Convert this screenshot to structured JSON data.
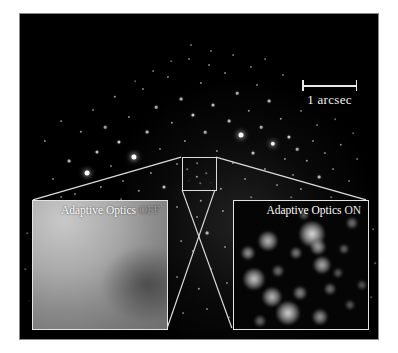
{
  "figure": {
    "background_color": "#ffffff",
    "sky_color": "#000000",
    "frame_border_color": "#8a8a8a"
  },
  "scalebar": {
    "label": "1 arcsec",
    "color": "#f2f2f2",
    "x": 301,
    "y": 79,
    "length_px": 55
  },
  "roi": {
    "name": "zoom-region",
    "x": 181,
    "y": 156,
    "width": 35,
    "height": 34,
    "border_color": "#dcdcdc"
  },
  "insets": {
    "left": {
      "label_main": "Adaptive Optics",
      "label_state": "OFF",
      "x": 31,
      "y": 199,
      "width": 136,
      "height": 130,
      "border_color": "#e4e4e4",
      "description": "seeing-limited blurred image, unresolved gray blob"
    },
    "right": {
      "label_main": "Adaptive Optics",
      "label_state": "ON",
      "x": 232,
      "y": 199,
      "width": 136,
      "height": 130,
      "border_color": "#e4e4e4",
      "description": "diffraction-limited image, individual stars resolved"
    }
  },
  "connectors": {
    "color": "#dcdcdc",
    "lines": [
      {
        "name": "roi-topleft-to-left-inset",
        "x1": 181,
        "y1": 157,
        "x2": 32,
        "y2": 200
      },
      {
        "name": "roi-topright-to-right-inset",
        "x1": 216,
        "y1": 157,
        "x2": 367,
        "y2": 200
      },
      {
        "name": "roi-bottomleft-to-right-inset",
        "x1": 182,
        "y1": 190,
        "x2": 232,
        "y2": 329
      },
      {
        "name": "roi-bottomright-to-left-inset",
        "x1": 215,
        "y1": 190,
        "x2": 167,
        "y2": 329
      }
    ]
  },
  "starfield": [
    {
      "x": 44,
      "y": 140,
      "r": 1.1,
      "o": 0.55
    },
    {
      "x": 52,
      "y": 178,
      "r": 1.0,
      "o": 0.5
    },
    {
      "x": 60,
      "y": 120,
      "r": 0.9,
      "o": 0.45
    },
    {
      "x": 68,
      "y": 160,
      "r": 1.4,
      "o": 0.7
    },
    {
      "x": 74,
      "y": 193,
      "r": 1.0,
      "o": 0.5
    },
    {
      "x": 80,
      "y": 131,
      "r": 1.2,
      "o": 0.6
    },
    {
      "x": 86,
      "y": 172,
      "r": 2.4,
      "o": 1.0
    },
    {
      "x": 92,
      "y": 109,
      "r": 1.0,
      "o": 0.5
    },
    {
      "x": 96,
      "y": 151,
      "r": 1.5,
      "o": 0.75
    },
    {
      "x": 100,
      "y": 186,
      "r": 1.1,
      "o": 0.55
    },
    {
      "x": 104,
      "y": 126,
      "r": 1.3,
      "o": 0.62
    },
    {
      "x": 110,
      "y": 165,
      "r": 1.0,
      "o": 0.5
    },
    {
      "x": 114,
      "y": 96,
      "r": 1.2,
      "o": 0.6
    },
    {
      "x": 118,
      "y": 141,
      "r": 1.6,
      "o": 0.8
    },
    {
      "x": 122,
      "y": 180,
      "r": 1.0,
      "o": 0.5
    },
    {
      "x": 128,
      "y": 116,
      "r": 1.1,
      "o": 0.55
    },
    {
      "x": 133,
      "y": 156,
      "r": 2.6,
      "o": 1.0
    },
    {
      "x": 138,
      "y": 190,
      "r": 1.2,
      "o": 0.58
    },
    {
      "x": 142,
      "y": 88,
      "r": 1.0,
      "o": 0.5
    },
    {
      "x": 146,
      "y": 131,
      "r": 1.4,
      "o": 0.7
    },
    {
      "x": 150,
      "y": 172,
      "r": 1.1,
      "o": 0.55
    },
    {
      "x": 155,
      "y": 106,
      "r": 1.3,
      "o": 0.65
    },
    {
      "x": 159,
      "y": 148,
      "r": 1.0,
      "o": 0.5
    },
    {
      "x": 163,
      "y": 186,
      "r": 1.5,
      "o": 0.75
    },
    {
      "x": 167,
      "y": 76,
      "r": 1.1,
      "o": 0.52
    },
    {
      "x": 171,
      "y": 122,
      "r": 1.2,
      "o": 0.6
    },
    {
      "x": 176,
      "y": 163,
      "r": 1.0,
      "o": 0.5
    },
    {
      "x": 180,
      "y": 98,
      "r": 1.4,
      "o": 0.7
    },
    {
      "x": 184,
      "y": 140,
      "r": 1.1,
      "o": 0.55
    },
    {
      "x": 188,
      "y": 58,
      "r": 1.0,
      "o": 0.48
    },
    {
      "x": 192,
      "y": 114,
      "r": 1.6,
      "o": 0.8
    },
    {
      "x": 196,
      "y": 176,
      "r": 1.2,
      "o": 0.6
    },
    {
      "x": 200,
      "y": 82,
      "r": 1.1,
      "o": 0.55
    },
    {
      "x": 204,
      "y": 131,
      "r": 1.3,
      "o": 0.65
    },
    {
      "x": 208,
      "y": 64,
      "r": 1.0,
      "o": 0.5
    },
    {
      "x": 212,
      "y": 104,
      "r": 1.5,
      "o": 0.75
    },
    {
      "x": 216,
      "y": 150,
      "r": 1.1,
      "o": 0.55
    },
    {
      "x": 220,
      "y": 188,
      "r": 1.2,
      "o": 0.6
    },
    {
      "x": 224,
      "y": 72,
      "r": 1.0,
      "o": 0.5
    },
    {
      "x": 228,
      "y": 120,
      "r": 1.4,
      "o": 0.7
    },
    {
      "x": 232,
      "y": 162,
      "r": 1.1,
      "o": 0.55
    },
    {
      "x": 236,
      "y": 92,
      "r": 1.3,
      "o": 0.65
    },
    {
      "x": 240,
      "y": 134,
      "r": 2.5,
      "o": 1.0
    },
    {
      "x": 244,
      "y": 178,
      "r": 1.0,
      "o": 0.5
    },
    {
      "x": 248,
      "y": 110,
      "r": 1.2,
      "o": 0.6
    },
    {
      "x": 252,
      "y": 152,
      "r": 1.5,
      "o": 0.75
    },
    {
      "x": 256,
      "y": 84,
      "r": 1.0,
      "o": 0.5
    },
    {
      "x": 260,
      "y": 126,
      "r": 1.3,
      "o": 0.65
    },
    {
      "x": 264,
      "y": 168,
      "r": 1.1,
      "o": 0.55
    },
    {
      "x": 268,
      "y": 100,
      "r": 1.4,
      "o": 0.7
    },
    {
      "x": 272,
      "y": 143,
      "r": 2.2,
      "o": 0.95
    },
    {
      "x": 276,
      "y": 184,
      "r": 1.0,
      "o": 0.5
    },
    {
      "x": 280,
      "y": 118,
      "r": 1.2,
      "o": 0.6
    },
    {
      "x": 284,
      "y": 158,
      "r": 1.1,
      "o": 0.55
    },
    {
      "x": 288,
      "y": 136,
      "r": 1.6,
      "o": 0.8
    },
    {
      "x": 292,
      "y": 174,
      "r": 1.0,
      "o": 0.5
    },
    {
      "x": 296,
      "y": 148,
      "r": 1.3,
      "o": 0.65
    },
    {
      "x": 300,
      "y": 188,
      "r": 1.1,
      "o": 0.55
    },
    {
      "x": 306,
      "y": 160,
      "r": 1.2,
      "o": 0.6
    },
    {
      "x": 312,
      "y": 140,
      "r": 1.0,
      "o": 0.5
    },
    {
      "x": 318,
      "y": 176,
      "r": 1.4,
      "o": 0.7
    },
    {
      "x": 324,
      "y": 152,
      "r": 1.1,
      "o": 0.52
    },
    {
      "x": 332,
      "y": 168,
      "r": 1.0,
      "o": 0.48
    },
    {
      "x": 340,
      "y": 144,
      "r": 1.2,
      "o": 0.55
    },
    {
      "x": 348,
      "y": 180,
      "r": 1.0,
      "o": 0.45
    },
    {
      "x": 356,
      "y": 158,
      "r": 0.9,
      "o": 0.4
    },
    {
      "x": 190,
      "y": 44,
      "r": 0.9,
      "o": 0.4
    },
    {
      "x": 210,
      "y": 50,
      "r": 1.0,
      "o": 0.45
    },
    {
      "x": 232,
      "y": 54,
      "r": 0.9,
      "o": 0.4
    },
    {
      "x": 250,
      "y": 66,
      "r": 1.1,
      "o": 0.5
    },
    {
      "x": 170,
      "y": 60,
      "r": 0.85,
      "o": 0.38
    },
    {
      "x": 152,
      "y": 70,
      "r": 0.9,
      "o": 0.4
    },
    {
      "x": 134,
      "y": 80,
      "r": 0.85,
      "o": 0.35
    },
    {
      "x": 264,
      "y": 58,
      "r": 0.9,
      "o": 0.4
    },
    {
      "x": 282,
      "y": 74,
      "r": 1.0,
      "o": 0.45
    },
    {
      "x": 300,
      "y": 110,
      "r": 1.0,
      "o": 0.48
    },
    {
      "x": 316,
      "y": 124,
      "r": 0.9,
      "o": 0.42
    },
    {
      "x": 334,
      "y": 118,
      "r": 0.85,
      "o": 0.38
    },
    {
      "x": 352,
      "y": 132,
      "r": 0.8,
      "o": 0.34
    },
    {
      "x": 200,
      "y": 200,
      "r": 1.2,
      "o": 0.6
    },
    {
      "x": 196,
      "y": 216,
      "r": 1.0,
      "o": 0.5
    },
    {
      "x": 206,
      "y": 232,
      "r": 1.4,
      "o": 0.7
    },
    {
      "x": 192,
      "y": 250,
      "r": 1.1,
      "o": 0.55
    },
    {
      "x": 210,
      "y": 268,
      "r": 1.0,
      "o": 0.5
    },
    {
      "x": 198,
      "y": 288,
      "r": 1.2,
      "o": 0.58
    },
    {
      "x": 206,
      "y": 308,
      "r": 1.0,
      "o": 0.48
    },
    {
      "x": 176,
      "y": 206,
      "r": 1.0,
      "o": 0.5
    },
    {
      "x": 222,
      "y": 210,
      "r": 1.1,
      "o": 0.55
    },
    {
      "x": 180,
      "y": 240,
      "r": 0.9,
      "o": 0.44
    },
    {
      "x": 224,
      "y": 246,
      "r": 1.0,
      "o": 0.5
    },
    {
      "x": 176,
      "y": 276,
      "r": 0.9,
      "o": 0.42
    },
    {
      "x": 226,
      "y": 282,
      "r": 1.0,
      "o": 0.48
    },
    {
      "x": 182,
      "y": 312,
      "r": 0.9,
      "o": 0.4
    },
    {
      "x": 228,
      "y": 316,
      "r": 0.85,
      "o": 0.38
    },
    {
      "x": 186,
      "y": 168,
      "r": 0.8,
      "o": 0.4
    },
    {
      "x": 196,
      "y": 162,
      "r": 0.85,
      "o": 0.45
    },
    {
      "x": 205,
      "y": 172,
      "r": 0.8,
      "o": 0.4
    },
    {
      "x": 199,
      "y": 182,
      "r": 0.75,
      "o": 0.35
    },
    {
      "x": 210,
      "y": 182,
      "r": 0.7,
      "o": 0.32
    },
    {
      "x": 188,
      "y": 180,
      "r": 0.7,
      "o": 0.3
    },
    {
      "x": 40,
      "y": 205,
      "r": 0.8,
      "o": 0.35
    },
    {
      "x": 60,
      "y": 196,
      "r": 0.9,
      "o": 0.4
    },
    {
      "x": 120,
      "y": 198,
      "r": 0.85,
      "o": 0.38
    },
    {
      "x": 150,
      "y": 202,
      "r": 0.9,
      "o": 0.42
    },
    {
      "x": 250,
      "y": 196,
      "r": 0.85,
      "o": 0.4
    },
    {
      "x": 290,
      "y": 196,
      "r": 0.8,
      "o": 0.36
    },
    {
      "x": 330,
      "y": 196,
      "r": 0.85,
      "o": 0.38
    },
    {
      "x": 360,
      "y": 200,
      "r": 0.8,
      "o": 0.35
    },
    {
      "x": 372,
      "y": 228,
      "r": 0.85,
      "o": 0.38
    },
    {
      "x": 374,
      "y": 262,
      "r": 0.8,
      "o": 0.34
    },
    {
      "x": 370,
      "y": 296,
      "r": 0.75,
      "o": 0.3
    },
    {
      "x": 26,
      "y": 232,
      "r": 0.8,
      "o": 0.32
    },
    {
      "x": 24,
      "y": 268,
      "r": 0.75,
      "o": 0.3
    },
    {
      "x": 28,
      "y": 300,
      "r": 0.7,
      "o": 0.28
    }
  ],
  "ao_stars": [
    {
      "x": 14,
      "y": 52,
      "r": 7,
      "o": 0.7
    },
    {
      "x": 34,
      "y": 40,
      "r": 10,
      "o": 0.85
    },
    {
      "x": 62,
      "y": 52,
      "r": 6,
      "o": 0.6
    },
    {
      "x": 78,
      "y": 33,
      "r": 13,
      "o": 1.0
    },
    {
      "x": 84,
      "y": 46,
      "r": 8,
      "o": 0.75
    },
    {
      "x": 44,
      "y": 70,
      "r": 6,
      "o": 0.55
    },
    {
      "x": 88,
      "y": 64,
      "r": 9,
      "o": 0.8
    },
    {
      "x": 20,
      "y": 78,
      "r": 11,
      "o": 0.9
    },
    {
      "x": 110,
      "y": 48,
      "r": 5,
      "o": 0.5
    },
    {
      "x": 118,
      "y": 22,
      "r": 6,
      "o": 0.55
    },
    {
      "x": 38,
      "y": 96,
      "r": 10,
      "o": 0.85
    },
    {
      "x": 66,
      "y": 92,
      "r": 7,
      "o": 0.65
    },
    {
      "x": 96,
      "y": 88,
      "r": 6,
      "o": 0.55
    },
    {
      "x": 54,
      "y": 112,
      "r": 12,
      "o": 0.95
    },
    {
      "x": 86,
      "y": 116,
      "r": 8,
      "o": 0.7
    },
    {
      "x": 116,
      "y": 104,
      "r": 5,
      "o": 0.45
    },
    {
      "x": 26,
      "y": 120,
      "r": 6,
      "o": 0.5
    },
    {
      "x": 104,
      "y": 72,
      "r": 5,
      "o": 0.45
    },
    {
      "x": 128,
      "y": 84,
      "r": 5,
      "o": 0.42
    },
    {
      "x": 70,
      "y": 14,
      "r": 5,
      "o": 0.45
    }
  ]
}
